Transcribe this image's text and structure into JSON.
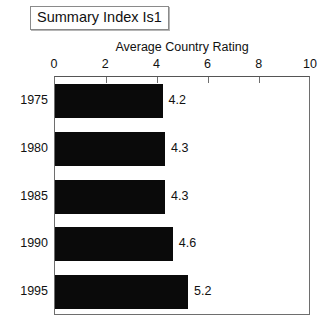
{
  "title_box": {
    "label": "Summary Index Is1"
  },
  "chart_data": {
    "type": "bar",
    "orientation": "horizontal",
    "title": "Summary Index Is1",
    "xlabel": "Average Country Rating",
    "ylabel": "",
    "categories": [
      "1975",
      "1980",
      "1985",
      "1990",
      "1995"
    ],
    "values": [
      4.2,
      4.3,
      4.3,
      4.6,
      5.2
    ],
    "value_labels": [
      "4.2",
      "4.3",
      "4.3",
      "4.6",
      "5.2"
    ],
    "xlim": [
      0,
      10
    ],
    "xticks": [
      0,
      2,
      4,
      6,
      8,
      10
    ],
    "xtick_labels": [
      "0",
      "2",
      "4",
      "6",
      "8",
      "10"
    ],
    "grid": false,
    "legend": false,
    "axis_position": "top",
    "bar_color": "#0a0a0a",
    "frame_color": "#6e6e6e",
    "background": "#ffffff"
  }
}
